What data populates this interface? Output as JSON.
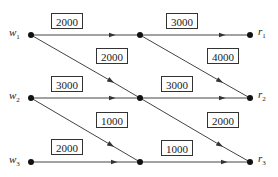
{
  "diagram": {
    "type": "network-flow",
    "nodes": [
      {
        "id": "w1",
        "label": "w",
        "sub": "1",
        "x": 31,
        "y": 35
      },
      {
        "id": "w2",
        "label": "w",
        "sub": "2",
        "x": 31,
        "y": 98
      },
      {
        "id": "w3",
        "label": "w",
        "sub": "3",
        "x": 31,
        "y": 162
      },
      {
        "id": "m1",
        "label": "",
        "x": 140,
        "y": 35
      },
      {
        "id": "m2",
        "label": "",
        "x": 140,
        "y": 98
      },
      {
        "id": "m3",
        "label": "",
        "x": 140,
        "y": 162
      },
      {
        "id": "r1",
        "label": "r",
        "sub": "1",
        "x": 250,
        "y": 35
      },
      {
        "id": "r2",
        "label": "r",
        "sub": "2",
        "x": 250,
        "y": 98
      },
      {
        "id": "r3",
        "label": "r",
        "sub": "3",
        "x": 250,
        "y": 162
      }
    ],
    "edges": [
      {
        "from": "w1",
        "to": "m1",
        "capacity": "2000"
      },
      {
        "from": "w1",
        "to": "m2",
        "capacity": "2000"
      },
      {
        "from": "w2",
        "to": "m2",
        "capacity": "3000"
      },
      {
        "from": "w2",
        "to": "m3",
        "capacity": "1000"
      },
      {
        "from": "w3",
        "to": "m3",
        "capacity": "2000"
      },
      {
        "from": "m1",
        "to": "r1",
        "capacity": "3000"
      },
      {
        "from": "m1",
        "to": "r2",
        "capacity": "4000"
      },
      {
        "from": "m2",
        "to": "r2",
        "capacity": "3000"
      },
      {
        "from": "m2",
        "to": "r3",
        "capacity": "2000"
      },
      {
        "from": "m3",
        "to": "r3",
        "capacity": "1000"
      }
    ]
  },
  "labels": {
    "w1": "w",
    "w1_sub": "1",
    "w2": "w",
    "w2_sub": "2",
    "w3": "w",
    "w3_sub": "3",
    "r1": "r",
    "r1_sub": "1",
    "r2": "r",
    "r2_sub": "2",
    "r3": "r",
    "r3_sub": "3"
  },
  "capacities": {
    "w1_m1": "2000",
    "w1_m2": "2000",
    "w2_m2": "3000",
    "w2_m3": "1000",
    "w3_m3": "2000",
    "m1_r1": "3000",
    "m1_r2": "4000",
    "m2_r2": "3000",
    "m2_r3": "2000",
    "m3_r3": "1000"
  }
}
